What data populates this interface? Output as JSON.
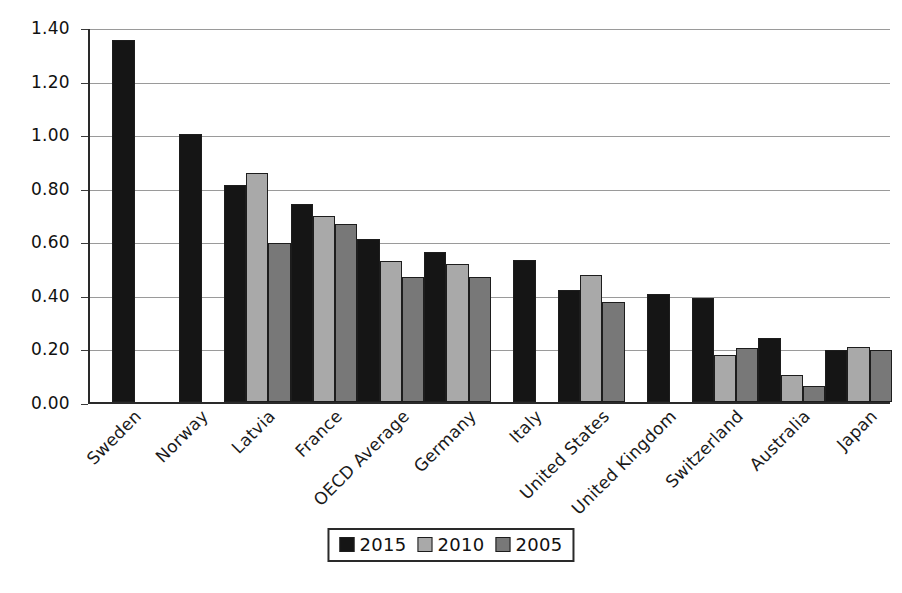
{
  "chart_data": {
    "type": "bar",
    "title": "",
    "subtitle": "",
    "xlabel": "",
    "ylabel": "",
    "ylim": [
      0.0,
      1.4
    ],
    "ytick_labels": [
      "1.40",
      "1.20",
      "1.00",
      "0.80",
      "0.60",
      "0.40",
      "0.20",
      "0.00"
    ],
    "ytick_values": [
      1.4,
      1.2,
      1.0,
      0.8,
      0.6,
      0.4,
      0.2,
      0.0
    ],
    "grid": true,
    "legend_position": "bottom-center",
    "categories": [
      "Sweden",
      "Norway",
      "Latvia",
      "France",
      "OECD Average",
      "Germany",
      "Italy",
      "United States",
      "United Kingdom",
      "Switzerland",
      "Australia",
      "Japan"
    ],
    "series": [
      {
        "name": "2015",
        "color": "#151515",
        "values": [
          1.35,
          1.0,
          0.81,
          0.74,
          0.61,
          0.56,
          0.53,
          0.42,
          0.405,
          0.39,
          0.24,
          0.195
        ]
      },
      {
        "name": "2010",
        "color": "#a9a9a9",
        "values": [
          null,
          null,
          0.855,
          0.695,
          0.525,
          0.515,
          null,
          0.475,
          null,
          0.175,
          0.1,
          0.205
        ]
      },
      {
        "name": "2005",
        "color": "#787878",
        "values": [
          null,
          null,
          0.595,
          0.665,
          0.465,
          0.465,
          null,
          0.375,
          null,
          0.2,
          0.06,
          0.195
        ]
      }
    ]
  },
  "legend": {
    "items": [
      {
        "label": "2015",
        "swatch": "s2015"
      },
      {
        "label": "2010",
        "swatch": "s2010"
      },
      {
        "label": "2005",
        "swatch": "s2005"
      }
    ]
  },
  "colors": {
    "series_2015": "#151515",
    "series_2010": "#a9a9a9",
    "series_2005": "#787878",
    "gridline": "#9a9a9a",
    "axis": "#2a2a2a",
    "background": "#ffffff"
  }
}
